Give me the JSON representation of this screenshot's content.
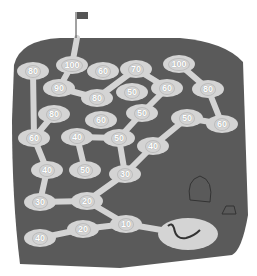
{
  "colors": {
    "board": "#5a5a5a",
    "path": "#d4d4d4",
    "background": "#ffffff",
    "flag": "#555555"
  },
  "icons": {
    "flag": "flag-icon",
    "worm": "worm-icon",
    "rock": "rock-icon",
    "log": "log-icon"
  },
  "nodes": [
    {
      "id": "n1",
      "label": "100",
      "x": 72,
      "y": 65
    },
    {
      "id": "n2",
      "label": "80",
      "x": 33,
      "y": 71
    },
    {
      "id": "n3",
      "label": "60",
      "x": 103,
      "y": 71
    },
    {
      "id": "n4",
      "label": "70",
      "x": 136,
      "y": 69
    },
    {
      "id": "n5",
      "label": "100",
      "x": 179,
      "y": 64
    },
    {
      "id": "n6",
      "label": "90",
      "x": 59,
      "y": 88
    },
    {
      "id": "n7",
      "label": "80",
      "x": 97,
      "y": 98
    },
    {
      "id": "n8",
      "label": "50",
      "x": 132,
      "y": 92
    },
    {
      "id": "n9",
      "label": "60",
      "x": 167,
      "y": 88
    },
    {
      "id": "n10",
      "label": "80",
      "x": 208,
      "y": 89
    },
    {
      "id": "n11",
      "label": "80",
      "x": 54,
      "y": 114
    },
    {
      "id": "n12",
      "label": "60",
      "x": 101,
      "y": 120
    },
    {
      "id": "n13",
      "label": "50",
      "x": 142,
      "y": 113
    },
    {
      "id": "n14",
      "label": "50",
      "x": 187,
      "y": 118
    },
    {
      "id": "n15",
      "label": "60",
      "x": 222,
      "y": 124
    },
    {
      "id": "n16",
      "label": "60",
      "x": 34,
      "y": 138
    },
    {
      "id": "n17",
      "label": "40",
      "x": 77,
      "y": 137
    },
    {
      "id": "n18",
      "label": "50",
      "x": 119,
      "y": 138
    },
    {
      "id": "n19",
      "label": "40",
      "x": 153,
      "y": 146
    },
    {
      "id": "n20",
      "label": "40",
      "x": 47,
      "y": 170
    },
    {
      "id": "n21",
      "label": "50",
      "x": 85,
      "y": 170
    },
    {
      "id": "n22",
      "label": "30",
      "x": 125,
      "y": 174
    },
    {
      "id": "n23",
      "label": "30",
      "x": 40,
      "y": 202
    },
    {
      "id": "n24",
      "label": "20",
      "x": 87,
      "y": 201
    },
    {
      "id": "n25",
      "label": "20",
      "x": 83,
      "y": 229
    },
    {
      "id": "n26",
      "label": "10",
      "x": 126,
      "y": 224
    },
    {
      "id": "n27",
      "label": "40",
      "x": 40,
      "y": 238
    }
  ]
}
